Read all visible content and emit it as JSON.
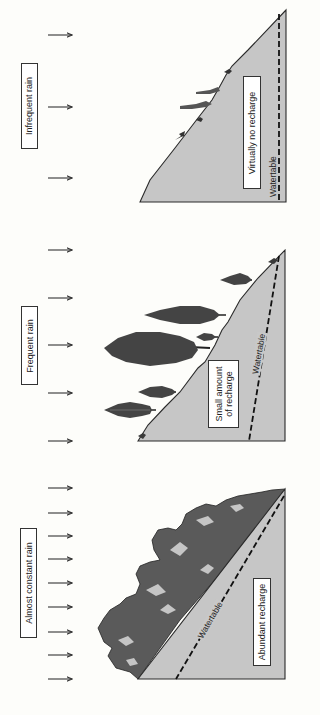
{
  "panels": [
    {
      "rain_label": "Infrequent rain",
      "recharge_label": "Virtually no recharge",
      "watertable_label": "Watertable",
      "arrow_count": 3,
      "vegetation": "sparse shrubs"
    },
    {
      "rain_label": "Frequent rain",
      "recharge_label_line1": "Small amount",
      "recharge_label_line2": "of recharge",
      "watertable_label": "Watertable",
      "arrow_count": 5,
      "vegetation": "conifer trees"
    },
    {
      "rain_label": "Almost constant rain",
      "recharge_label": "Abundant recharge",
      "watertable_label": "Watertable",
      "arrow_count": 9,
      "vegetation": "dense forest"
    }
  ],
  "colors": {
    "ground": "#c6c6c6",
    "outline": "#2a2a2a",
    "background": "#fdfdfa"
  }
}
